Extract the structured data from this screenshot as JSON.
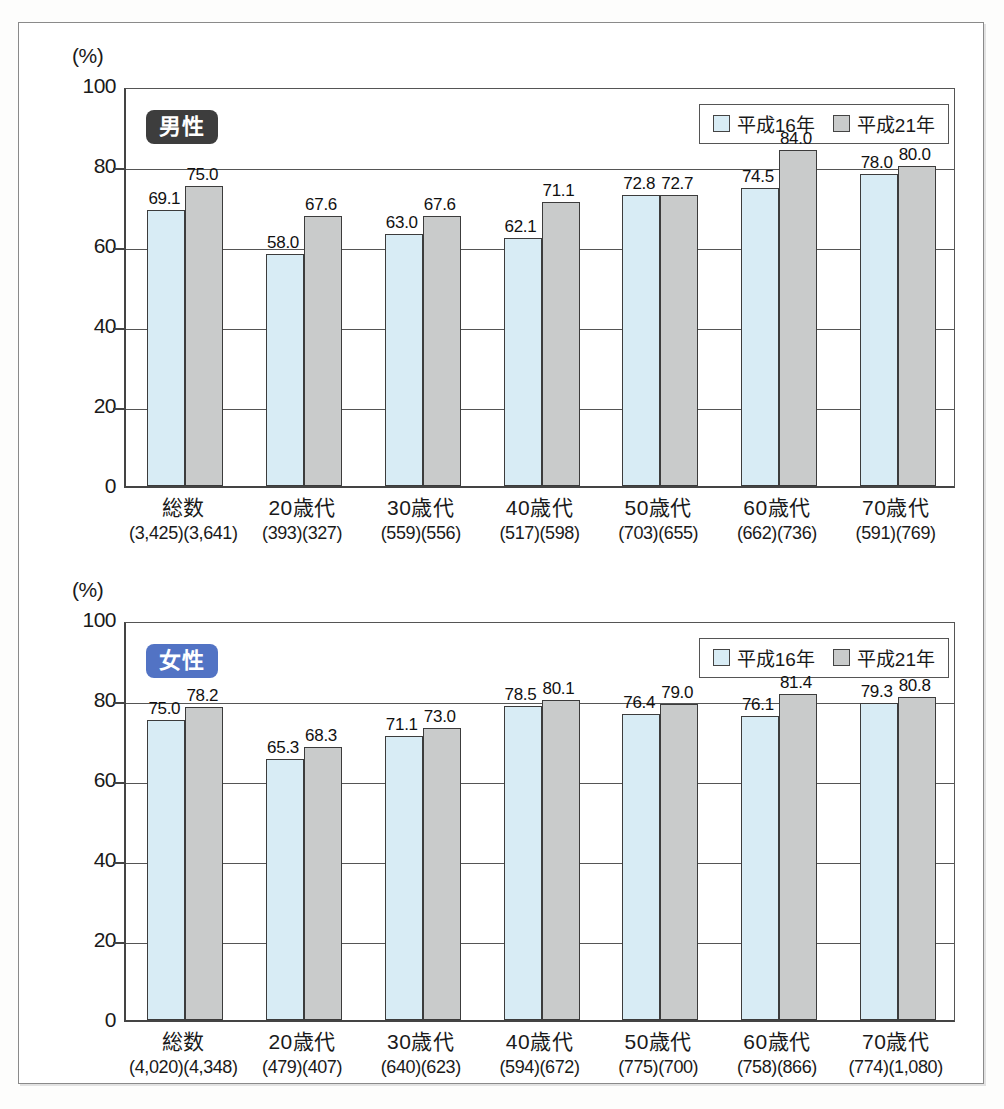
{
  "frame": {
    "border_color": "#8a8a8a"
  },
  "legend": {
    "series": [
      {
        "label": "平成16年",
        "color": "#d8ecf5",
        "key": "h16"
      },
      {
        "label": "平成21年",
        "color": "#c9cbcb",
        "key": "h21"
      }
    ]
  },
  "axis": {
    "unit_label": "(%)",
    "ticks": [
      "100",
      "80",
      "60",
      "40",
      "20",
      "0"
    ],
    "tick_values": [
      100,
      80,
      60,
      40,
      20,
      0
    ],
    "ylim": [
      0,
      100
    ]
  },
  "charts": [
    {
      "id": "male",
      "badge_label": "男性",
      "badge_color": "#3d3d3d",
      "unit_label": "(%)"
    },
    {
      "id": "female",
      "badge_label": "女性",
      "badge_color": "#5273c4",
      "unit_label": "(%)"
    }
  ],
  "chart_data": [
    {
      "type": "bar",
      "title": "男性",
      "xlabel": "",
      "ylabel": "(%)",
      "ylim": [
        0,
        100
      ],
      "grid": true,
      "legend_position": "top-right",
      "categories": [
        "総数",
        "20歳代",
        "30歳代",
        "40歳代",
        "50歳代",
        "60歳代",
        "70歳代"
      ],
      "series": [
        {
          "name": "平成16年",
          "color": "#d8ecf5",
          "values": [
            69.1,
            58.0,
            63.0,
            62.1,
            72.8,
            74.5,
            78.0
          ],
          "n": [
            "(3,425)",
            "(393)",
            "(559)",
            "(517)",
            "(703)",
            "(662)",
            "(591)"
          ]
        },
        {
          "name": "平成21年",
          "color": "#c9cbcb",
          "values": [
            75.0,
            67.6,
            67.6,
            71.1,
            72.7,
            84.0,
            80.0
          ],
          "n": [
            "(3,641)",
            "(327)",
            "(556)",
            "(598)",
            "(655)",
            "(736)",
            "(769)"
          ]
        }
      ],
      "value_labels": [
        [
          "69.1",
          "75.0"
        ],
        [
          "58.0",
          "67.6"
        ],
        [
          "63.0",
          "67.6"
        ],
        [
          "62.1",
          "71.1"
        ],
        [
          "72.8",
          "72.7"
        ],
        [
          "74.5",
          "84.0"
        ],
        [
          "78.0",
          "80.0"
        ]
      ]
    },
    {
      "type": "bar",
      "title": "女性",
      "xlabel": "",
      "ylabel": "(%)",
      "ylim": [
        0,
        100
      ],
      "grid": true,
      "legend_position": "top-right",
      "categories": [
        "総数",
        "20歳代",
        "30歳代",
        "40歳代",
        "50歳代",
        "60歳代",
        "70歳代"
      ],
      "series": [
        {
          "name": "平成16年",
          "color": "#d8ecf5",
          "values": [
            75.0,
            65.3,
            71.1,
            78.5,
            76.4,
            76.1,
            79.3
          ],
          "n": [
            "(4,020)",
            "(479)",
            "(640)",
            "(594)",
            "(775)",
            "(758)",
            "(774)"
          ]
        },
        {
          "name": "平成21年",
          "color": "#c9cbcb",
          "values": [
            78.2,
            68.3,
            73.0,
            80.1,
            79.0,
            81.4,
            80.8
          ],
          "n": [
            "(4,348)",
            "(407)",
            "(623)",
            "(672)",
            "(700)",
            "(866)",
            "(1,080)"
          ]
        }
      ],
      "value_labels": [
        [
          "75.0",
          "78.2"
        ],
        [
          "65.3",
          "68.3"
        ],
        [
          "71.1",
          "73.0"
        ],
        [
          "78.5",
          "80.1"
        ],
        [
          "76.4",
          "79.0"
        ],
        [
          "76.1",
          "81.4"
        ],
        [
          "79.3",
          "80.8"
        ]
      ]
    }
  ]
}
